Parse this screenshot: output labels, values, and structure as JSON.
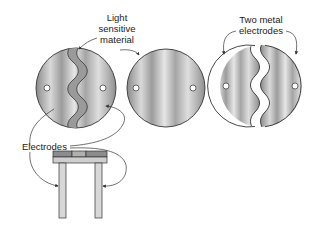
{
  "labels": {
    "light_sensitive": [
      "Light",
      "sensitive",
      "material"
    ],
    "two_metal": [
      "Two metal",
      "electrodes"
    ],
    "electrodes": "Electrodes"
  },
  "colors": {
    "metal_dark": "#8a8a8a",
    "metal_light": "#e4e4e4",
    "outline": "#333333",
    "strip": "#9a9a9a",
    "bar_dark": "#8c8c8c",
    "bar_light": "#cfcfcf"
  }
}
